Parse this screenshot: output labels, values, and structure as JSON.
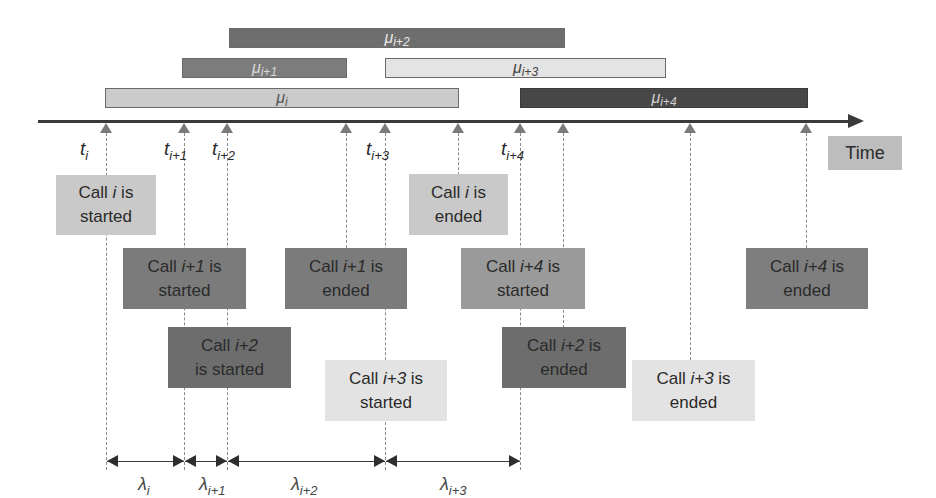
{
  "diagram": {
    "axis_label": "Time",
    "colors": {
      "call_i": "#c8c8c8",
      "call_i1": "#7a7a7a",
      "call_i2": "#6a6a6a",
      "call_i3": "#e2e2e2",
      "call_i4": "#4a4a4a",
      "axis": "#3a3a3a",
      "time_box": "#bdbdbd"
    },
    "service_bars": [
      {
        "symbol": "μ",
        "sub": "i+2",
        "call": "i+2"
      },
      {
        "symbol": "μ",
        "sub": "i+1",
        "call": "i+1"
      },
      {
        "symbol": "μ",
        "sub": "i+3",
        "call": "i+3"
      },
      {
        "symbol": "μ",
        "sub": "i",
        "call": "i"
      },
      {
        "symbol": "μ",
        "sub": "i+4",
        "call": "i+4"
      }
    ],
    "arrival_labels": [
      {
        "symbol": "t",
        "sub": "i"
      },
      {
        "symbol": "t",
        "sub": "i+1"
      },
      {
        "symbol": "t",
        "sub": "i+2"
      },
      {
        "symbol": "t",
        "sub": "i+3"
      },
      {
        "symbol": "t",
        "sub": "i+4"
      }
    ],
    "events": [
      {
        "pre": "Call ",
        "idx": "i",
        "post1": " is",
        "line2": "started"
      },
      {
        "pre": "Call ",
        "idx": "i+1",
        "post1": " is",
        "line2": "started"
      },
      {
        "pre": "Call ",
        "idx": "i+2",
        "post1": "",
        "line2": "is started"
      },
      {
        "pre": "Call ",
        "idx": "i+1",
        "post1": " is",
        "line2": "ended"
      },
      {
        "pre": "Call ",
        "idx": "i+3",
        "post1": " is",
        "line2": "started"
      },
      {
        "pre": "Call ",
        "idx": "i",
        "post1": " is",
        "line2": "ended"
      },
      {
        "pre": "Call ",
        "idx": "i+4",
        "post1": " is",
        "line2": "started"
      },
      {
        "pre": "Call ",
        "idx": "i+2",
        "post1": " is",
        "line2": "ended"
      },
      {
        "pre": "Call ",
        "idx": "i+3",
        "post1": " is",
        "line2": "ended"
      },
      {
        "pre": "Call ",
        "idx": "i+4",
        "post1": " is",
        "line2": "ended"
      }
    ],
    "interarrival_labels": [
      {
        "symbol": "λ",
        "sub": "i"
      },
      {
        "symbol": "λ",
        "sub": "i+1"
      },
      {
        "symbol": "λ",
        "sub": "i+2"
      },
      {
        "symbol": "λ",
        "sub": "i+3"
      }
    ]
  }
}
